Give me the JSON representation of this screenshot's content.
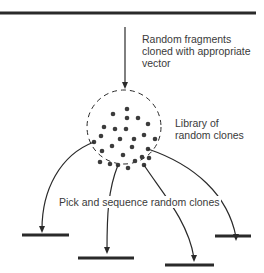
{
  "diagram": {
    "colors": {
      "line": "#2a2a2a",
      "text": "#3a3a3a",
      "dot": "#3c3c3c",
      "background": "#ffffff"
    },
    "source_dna": {
      "label": ""
    },
    "step1": {
      "lines": [
        "Random fragments",
        "cloned with appropriate",
        "vector"
      ]
    },
    "library": {
      "lines": [
        "Library of",
        "random clones"
      ]
    },
    "step2": {
      "label": "Pick and sequence random clones"
    },
    "reads": [
      {
        "id": "read-1"
      },
      {
        "id": "read-2"
      },
      {
        "id": "read-3"
      },
      {
        "id": "read-4"
      }
    ]
  }
}
